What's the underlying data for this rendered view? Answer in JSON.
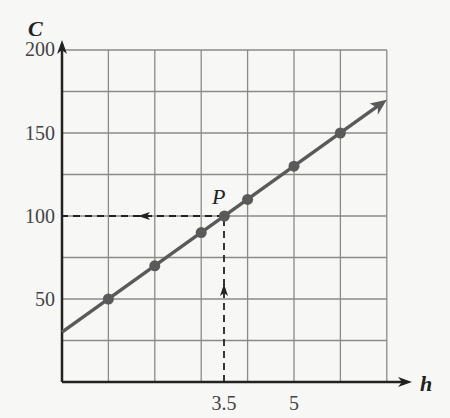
{
  "chart_data": {
    "type": "line",
    "title": "",
    "xlabel": "h",
    "ylabel": "C",
    "xlim": [
      0,
      7
    ],
    "ylim": [
      0,
      200
    ],
    "grid": true,
    "x_ticks_labeled": [
      "3.5",
      "5"
    ],
    "y_ticks_labeled": [
      "50",
      "100",
      "150",
      "200"
    ],
    "grid_x_step": 1,
    "grid_y_step": 25,
    "series": [
      {
        "name": "C = 20h + 30",
        "x": [
          1,
          2,
          3,
          3.5,
          4,
          5,
          6
        ],
        "values": [
          50,
          70,
          90,
          100,
          110,
          130,
          150
        ]
      }
    ],
    "line_start": [
      0,
      30
    ],
    "line_end_arrow": [
      7,
      170
    ],
    "annotations": [
      {
        "label": "P",
        "x": 3.5,
        "y": 100,
        "note": "dashed arrows from h=3.5 up to line and from P left to C=100"
      }
    ]
  },
  "labels": {
    "x_axis": "h",
    "y_axis": "C",
    "point": "P",
    "xt1": "3.5",
    "xt2": "5",
    "yt50": "50",
    "yt100": "100",
    "yt150": "150",
    "yt200": "200"
  },
  "colors": {
    "line": "#5a5a5a",
    "grid": "#8a8a8a",
    "axis": "#222222"
  }
}
